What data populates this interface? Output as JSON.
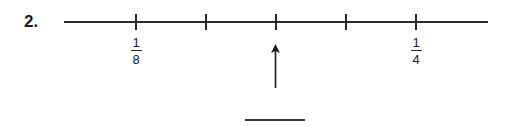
{
  "problem": {
    "number_label": "2.",
    "number_line": {
      "tick_count": 5,
      "ticks": [
        {
          "position": 136,
          "label": {
            "numerator": "1",
            "denominator": "8"
          }
        },
        {
          "position": 206,
          "label": null
        },
        {
          "position": 276,
          "label": null,
          "arrow": true
        },
        {
          "position": 346,
          "label": null
        },
        {
          "position": 416,
          "label": {
            "numerator": "1",
            "denominator": "4"
          }
        }
      ]
    },
    "labels": {
      "left": {
        "numerator": "1",
        "denominator": "8"
      },
      "right": {
        "numerator": "1",
        "denominator": "4"
      }
    },
    "arrow_icon": "up-arrow-icon",
    "answer_blank": ""
  }
}
